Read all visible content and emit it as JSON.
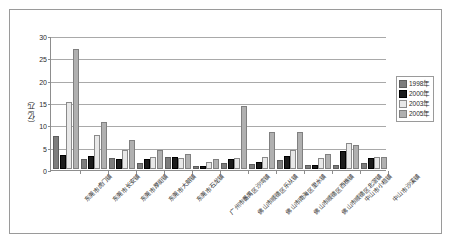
{
  "chart_data": {
    "type": "bar",
    "title": "",
    "subtitle": "",
    "xlabel": "",
    "ylabel": "（亿元）",
    "ylim": [
      0,
      30
    ],
    "yticks": [
      0,
      5,
      10,
      15,
      20,
      25,
      30
    ],
    "grid": true,
    "legend_position": "right",
    "categories": [
      "东莞市虎门镇",
      "东莞市长安镇",
      "东莞市厚街镇",
      "东莞市大朗镇",
      "东莞市石龙镇",
      "广州市番禺区沙湾镇",
      "佛山市顺德区乐从镇",
      "佛山市南海区里水镇",
      "佛山市顺德区西樵镇",
      "佛山市顺德区北滘镇",
      "中山市小榄镇",
      "中山市沙溪镇"
    ],
    "series": [
      {
        "name": "1998年",
        "color": "#7d7d7d",
        "values": [
          7.0,
          1.9,
          2.1,
          0.8,
          2.3,
          0.2,
          0.8,
          0.7,
          1.6,
          0.4,
          0.5,
          0.9
        ]
      },
      {
        "name": "2000年",
        "color": "#1c1c1c",
        "values": [
          2.7,
          2.4,
          1.7,
          1.9,
          2.2,
          0.3,
          1.9,
          1.2,
          2.5,
          0.5,
          3.5,
          2.1
        ]
      },
      {
        "name": "2003年",
        "color": "#e8e8e8",
        "values": [
          14.5,
          7.2,
          3.7,
          2.3,
          2.1,
          1.2,
          2.1,
          2.2,
          3.9,
          2.0,
          5.3,
          2.2
        ]
      },
      {
        "name": "2005年",
        "color": "#b0b0b0",
        "values": [
          26.4,
          10.0,
          6.1,
          3.7,
          2.9,
          1.8,
          13.6,
          7.8,
          7.8,
          3.0,
          4.9,
          2.2
        ]
      }
    ]
  },
  "legend": {
    "items": [
      "1998年",
      "2000年",
      "2003年",
      "2005年"
    ]
  }
}
